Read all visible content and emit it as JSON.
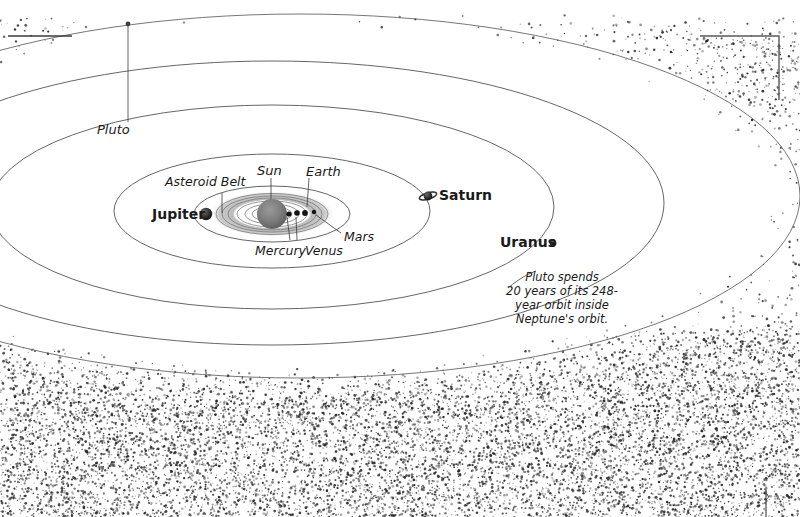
{
  "figure": {
    "kind": "solar-system-diagram",
    "background_color": "#ffffff",
    "ink_color": "#1a1a1a",
    "orbit_line_color": "#4a4a4a",
    "stipple_color": "#2b2b2b",
    "asteroid_belt_color": "#b5b5b5"
  },
  "labels": {
    "pluto": "Pluto",
    "asteroid_belt": "Asteroid Belt",
    "sun": "Sun",
    "earth": "Earth",
    "jupiter": "Jupiter",
    "saturn": "Saturn",
    "uranus": "Uranus",
    "mercury": "Mercury",
    "venus": "Venus",
    "mars": "Mars"
  },
  "annotation": {
    "text": "Pluto spends\n20 years of its 248-\nyear orbit inside\nNeptune's orbit."
  },
  "chart_data": {
    "type": "scatter",
    "title": "",
    "xlabel": "",
    "ylabel": "",
    "bodies": [
      {
        "name": "Sun",
        "label_style": "italic",
        "marker": "large-sphere",
        "x": 272,
        "y": 214
      },
      {
        "name": "Mercury",
        "label_style": "italic",
        "marker": "small-dot",
        "x": 289,
        "y": 214
      },
      {
        "name": "Venus",
        "label_style": "italic",
        "marker": "small-dot",
        "x": 297,
        "y": 213
      },
      {
        "name": "Earth",
        "label_style": "italic",
        "marker": "small-dot",
        "x": 305,
        "y": 213
      },
      {
        "name": "Mars",
        "label_style": "italic",
        "marker": "small-dot",
        "x": 314,
        "y": 212
      },
      {
        "name": "Jupiter",
        "label_style": "bold",
        "marker": "sphere",
        "x": 206,
        "y": 214
      },
      {
        "name": "Saturn",
        "label_style": "bold",
        "marker": "ringed-sphere",
        "x": 428,
        "y": 196
      },
      {
        "name": "Uranus",
        "label_style": "bold",
        "marker": "small-sphere",
        "x": 553,
        "y": 243
      },
      {
        "name": "Pluto",
        "label_style": "italic",
        "marker": "tiny-dot",
        "x": 128,
        "y": 24
      }
    ],
    "orbits": [
      {
        "name": "inner-planets",
        "cx": 272,
        "cy": 214,
        "rx": 46,
        "ry": 17
      },
      {
        "name": "jupiter",
        "cx": 272,
        "cy": 214,
        "rx": 78,
        "ry": 28
      },
      {
        "name": "saturn",
        "cx": 272,
        "cy": 211,
        "rx": 158,
        "ry": 57
      },
      {
        "name": "uranus",
        "cx": 272,
        "cy": 207,
        "rx": 282,
        "ry": 102
      },
      {
        "name": "neptune",
        "cx": 272,
        "cy": 203,
        "rx": 392,
        "ry": 142
      },
      {
        "name": "pluto",
        "cx": 300,
        "cy": 196,
        "rx": 500,
        "ry": 182
      }
    ],
    "annotations": [
      "Pluto spends 20 years of its 248-year orbit inside Neptune's orbit."
    ],
    "legend": []
  },
  "registration_marks": [
    {
      "name": "top-left-rule",
      "orientation": "horizontal"
    },
    {
      "name": "top-right-corner",
      "orientation": "corner"
    },
    {
      "name": "bottom-right-tick",
      "orientation": "vertical"
    }
  ]
}
